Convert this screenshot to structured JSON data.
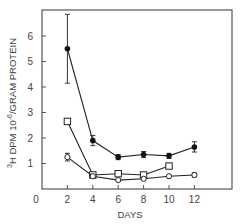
{
  "chart_data": {
    "type": "line",
    "title": "",
    "xlabel": "DAYS",
    "ylabel": "3H DPM 10^-6/GRAM PROTEIN",
    "ylabel_parts": {
      "sup": "3",
      "main": "H DPM 10",
      "exp": "-6",
      "tail": "/GRAM PROTEIN"
    },
    "xlim": [
      0,
      15
    ],
    "ylim": [
      0,
      7
    ],
    "x_ticks": [
      0,
      2,
      4,
      6,
      8,
      10,
      12
    ],
    "y_ticks": [
      1,
      2,
      3,
      4,
      5,
      6
    ],
    "grid": false,
    "legend": "none",
    "series": [
      {
        "name": "filled-circle",
        "marker": "filled-circle",
        "x": [
          2,
          4,
          6,
          8,
          10,
          12
        ],
        "values": [
          5.5,
          1.9,
          1.25,
          1.35,
          1.3,
          1.65
        ],
        "err": [
          1.35,
          0.2,
          0.1,
          0.12,
          0.1,
          0.2
        ]
      },
      {
        "name": "open-square",
        "marker": "open-square",
        "x": [
          2,
          4,
          6,
          8,
          10
        ],
        "values": [
          2.65,
          0.55,
          0.6,
          0.55,
          0.9
        ],
        "err": [
          0,
          0,
          0,
          0,
          0
        ]
      },
      {
        "name": "open-circle",
        "marker": "open-circle",
        "x": [
          2,
          4,
          6,
          8,
          10,
          12
        ],
        "values": [
          1.25,
          0.5,
          0.35,
          0.4,
          0.5,
          0.55
        ],
        "err": [
          0.15,
          0,
          0,
          0,
          0,
          0.08
        ]
      }
    ]
  }
}
